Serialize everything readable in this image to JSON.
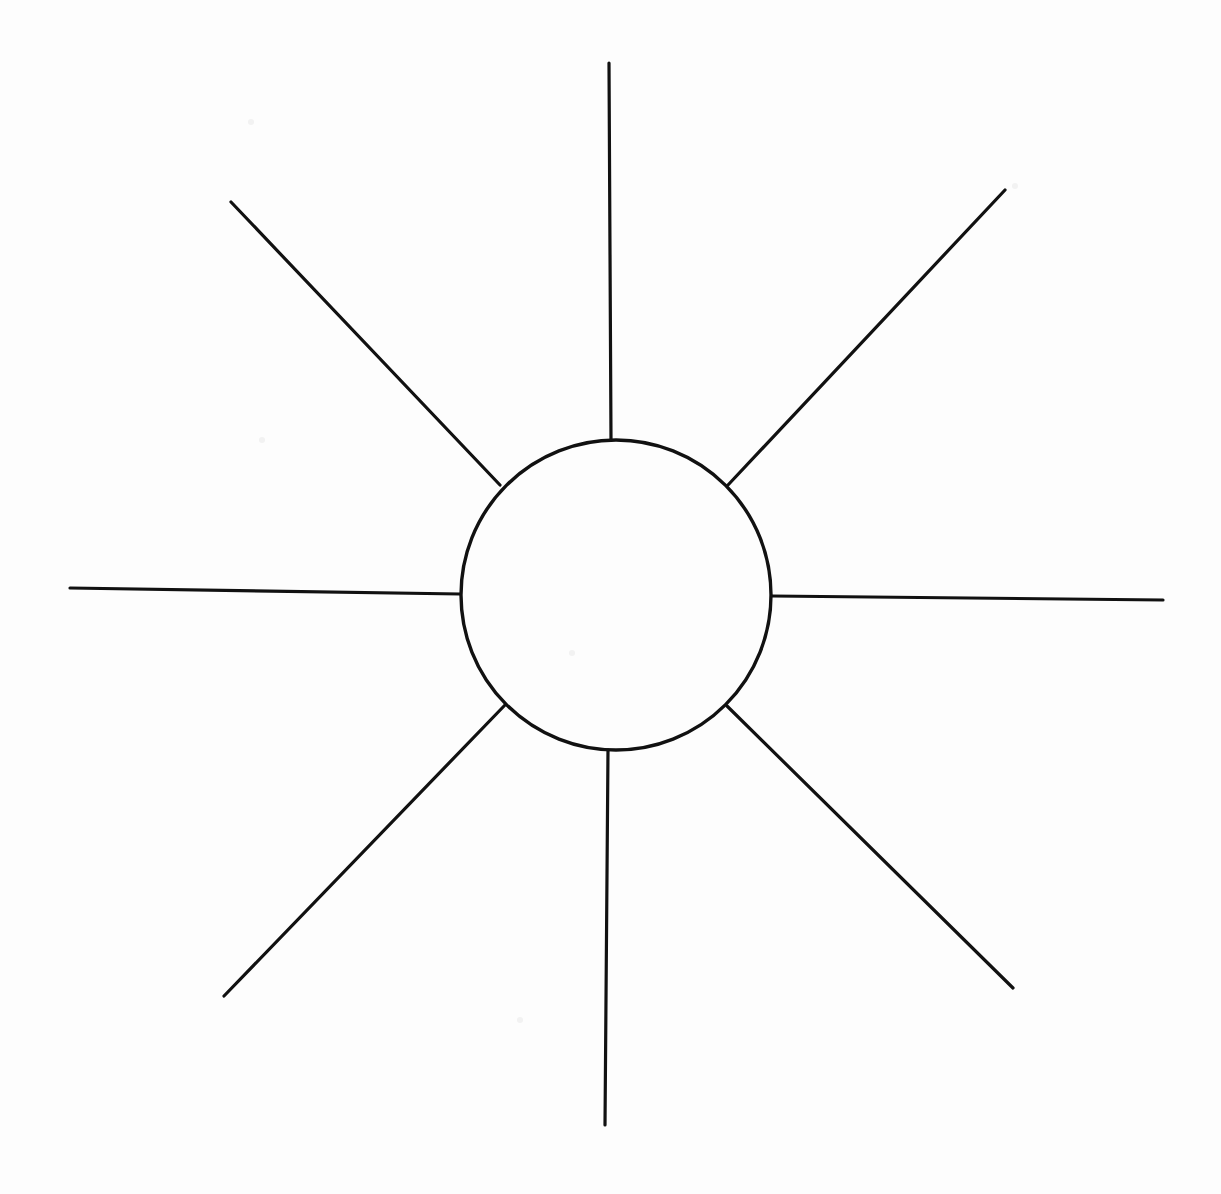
{
  "document": {
    "title": "Sun Radial Diagram",
    "type": "line-drawing",
    "description": "Hand-drawn sun symbol: a single circle with eight straight rays radiating outward",
    "background_color": "#fdfdfd",
    "ink_color": "#111111",
    "canvas": {
      "width": 1221,
      "height": 1194
    }
  },
  "figure": {
    "name": "sun-symbol",
    "stroke_color": "#111111",
    "stroke_width": 3.2,
    "fill": "none",
    "center": {
      "x": 616,
      "y": 595
    },
    "circle": {
      "label": "core-circle",
      "cx": 616,
      "cy": 595,
      "r": 155,
      "stroke_width": 3.4
    },
    "ray_count": 8,
    "rays": [
      {
        "label": "ray-north",
        "direction": "north",
        "angle_deg": 90,
        "inner": {
          "x": 611,
          "y": 440
        },
        "outer": {
          "x": 609,
          "y": 63
        },
        "length": 377
      },
      {
        "label": "ray-northeast",
        "direction": "northeast",
        "angle_deg": 45,
        "inner": {
          "x": 728,
          "y": 485
        },
        "outer": {
          "x": 1005,
          "y": 190
        },
        "length": 404
      },
      {
        "label": "ray-east",
        "direction": "east",
        "angle_deg": 0,
        "inner": {
          "x": 772,
          "y": 596
        },
        "outer": {
          "x": 1163,
          "y": 600
        },
        "length": 391
      },
      {
        "label": "ray-southeast",
        "direction": "southeast",
        "angle_deg": -45,
        "inner": {
          "x": 727,
          "y": 706
        },
        "outer": {
          "x": 1013,
          "y": 988
        },
        "length": 402
      },
      {
        "label": "ray-south",
        "direction": "south",
        "angle_deg": -90,
        "inner": {
          "x": 608,
          "y": 750
        },
        "outer": {
          "x": 605,
          "y": 1125
        },
        "length": 375
      },
      {
        "label": "ray-southwest",
        "direction": "southwest",
        "angle_deg": 225,
        "inner": {
          "x": 505,
          "y": 705
        },
        "outer": {
          "x": 224,
          "y": 996
        },
        "length": 405
      },
      {
        "label": "ray-west",
        "direction": "west",
        "angle_deg": 180,
        "inner": {
          "x": 460,
          "y": 594
        },
        "outer": {
          "x": 70,
          "y": 588
        },
        "length": 390
      },
      {
        "label": "ray-northwest",
        "direction": "northwest",
        "angle_deg": 135,
        "inner": {
          "x": 500,
          "y": 485
        },
        "outer": {
          "x": 231,
          "y": 202
        },
        "length": 390
      }
    ]
  }
}
